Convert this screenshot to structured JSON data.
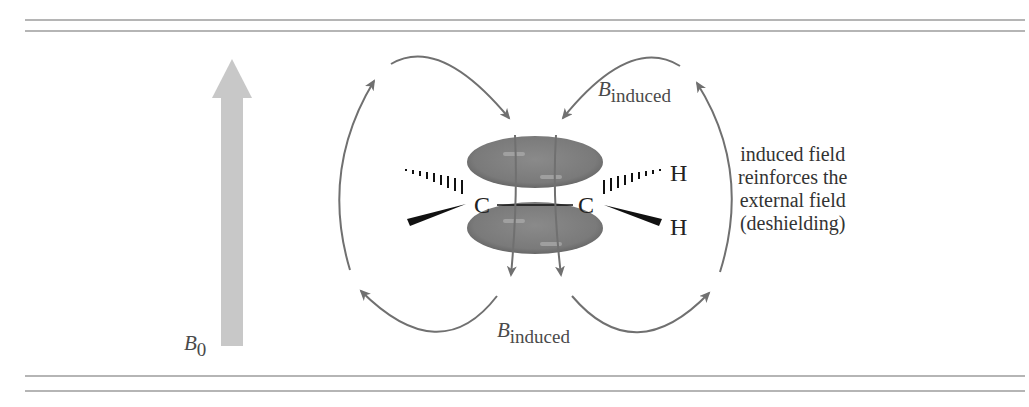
{
  "figure": {
    "external_field": {
      "symbol": "B",
      "subscript": "0"
    },
    "induced_field_top": {
      "symbol": "B",
      "subscript": "induced"
    },
    "induced_field_bottom": {
      "symbol": "B",
      "subscript": "induced"
    },
    "atoms": {
      "carbon_left": "C",
      "carbon_right": "C",
      "hydrogen_top_right": "H",
      "hydrogen_bottom_right": "H"
    },
    "caption_lines": [
      "induced field",
      "reinforces the",
      "external field",
      "(deshielding)"
    ],
    "colors": {
      "rule_lines": "#b5b5b5",
      "external_arrow": "#c8c8c8",
      "field_lines": "#707070",
      "pi_lobes": "#7b7b7b",
      "bonds": "#111111"
    }
  }
}
